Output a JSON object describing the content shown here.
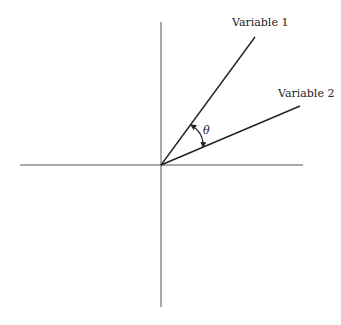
{
  "diagram": {
    "type": "vector-angle",
    "vectors": [
      {
        "name": "Variable 1",
        "label": "Variable 1"
      },
      {
        "name": "Variable 2",
        "label": "Variable 2"
      }
    ],
    "angle_label": "θ",
    "axes": {
      "horizontal": true,
      "vertical": true
    },
    "colors": {
      "line": "#222222",
      "background": "#ffffff"
    }
  }
}
